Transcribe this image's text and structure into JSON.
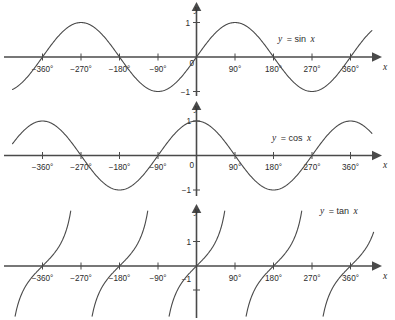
{
  "figure": {
    "background_color": "#ffffff",
    "ink_color": "#4a4a4a",
    "text_color": "#2b2b2b"
  },
  "chart_data": [
    {
      "type": "line",
      "id": "sine-plot",
      "title": "",
      "function": "sin",
      "legend": "y = sin x",
      "legend_var": "y",
      "legend_rhs": "= sin",
      "legend_arg": "x",
      "xlabel": "x",
      "ylabel": "y",
      "origin_label": "0",
      "xlim": [
        -420,
        420
      ],
      "ylim": [
        -1.45,
        1.45
      ],
      "grid": false,
      "xticks": [
        -360,
        -270,
        -180,
        -90,
        90,
        180,
        270,
        360
      ],
      "xtick_labels": [
        "−360°",
        "−270°",
        "−180°",
        "−90°",
        "90°",
        "180°",
        "270°",
        "360°"
      ],
      "yticks": [
        1,
        -1
      ],
      "ytick_labels": [
        "1",
        "−1"
      ],
      "key_points": {
        "zeros_deg": [
          -360,
          -180,
          0,
          180,
          360
        ],
        "maxima_deg": [
          -270,
          90
        ],
        "minima_deg": [
          -90,
          270
        ],
        "amplitude": 1,
        "period_deg": 360
      }
    },
    {
      "type": "line",
      "id": "cosine-plot",
      "title": "",
      "function": "cos",
      "legend": "y = cos x",
      "legend_var": "y",
      "legend_rhs": "= cos",
      "legend_arg": "x",
      "xlabel": "x",
      "ylabel": "y",
      "origin_label": "0",
      "xlim": [
        -420,
        420
      ],
      "ylim": [
        -1.45,
        1.45
      ],
      "grid": false,
      "xticks": [
        -360,
        -270,
        -180,
        -90,
        90,
        180,
        270,
        360
      ],
      "xtick_labels": [
        "−360°",
        "−270°",
        "−180°",
        "−90°",
        "90°",
        "180°",
        "270°",
        "360°"
      ],
      "yticks": [
        1,
        -1
      ],
      "ytick_labels": [
        "1",
        "−1"
      ],
      "key_points": {
        "zeros_deg": [
          -270,
          -90,
          90,
          270
        ],
        "maxima_deg": [
          -360,
          0,
          360
        ],
        "minima_deg": [
          -180,
          180
        ],
        "amplitude": 1,
        "period_deg": 360
      }
    },
    {
      "type": "line",
      "id": "tangent-plot",
      "title": "",
      "function": "tan",
      "legend": "y = tan x",
      "legend_var": "y",
      "legend_rhs": "= tan",
      "legend_arg": "x",
      "xlabel": "x",
      "ylabel": "y",
      "origin_label": "",
      "xlim": [
        -420,
        420
      ],
      "ylim": [
        -2.6,
        2.6
      ],
      "grid": false,
      "xticks": [
        -360,
        -270,
        -180,
        -90,
        90,
        180,
        270,
        360
      ],
      "xtick_labels": [
        "−360°",
        "−270°",
        "−180°",
        "−90°",
        "90°",
        "180°",
        "270°",
        "360°"
      ],
      "yticks": [
        1,
        -1
      ],
      "ytick_labels": [
        "1",
        "−1"
      ],
      "key_points": {
        "zeros_deg": [
          -360,
          -180,
          0,
          180,
          360
        ],
        "asymptotes_deg": [
          -450,
          -270,
          -90,
          90,
          270,
          450
        ],
        "period_deg": 180
      }
    }
  ]
}
